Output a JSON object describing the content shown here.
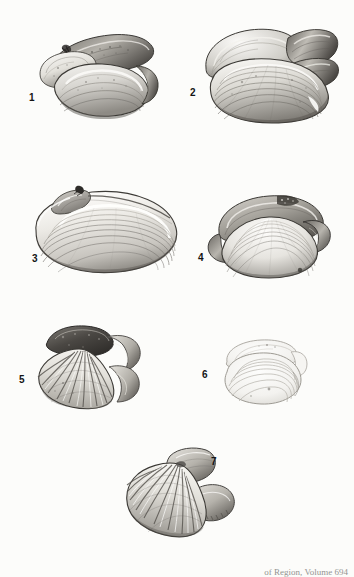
{
  "plate": {
    "medium": "halftone engraving / photographic plate",
    "subject": "fossil bivalve mollusc shells",
    "background_color": "#fcfcfa",
    "ink_color": "#2b2b2b",
    "caption": "of Region, Volume 694"
  },
  "figures": [
    {
      "number": "1",
      "label_x": 29,
      "label_y": 93,
      "description": "Paired elongate mytiliform bivalve valves, oblique view",
      "shell_type": "mussel-like bivalve",
      "ornament": "smooth with fine growth lines",
      "x": 36,
      "y": 26,
      "w": 122,
      "h": 92
    },
    {
      "number": "2",
      "label_x": 190,
      "label_y": 88,
      "description": "Two overlapping broad bivalve valves with strong concentric growth rings",
      "shell_type": "venerid bivalve",
      "ornament": "concentric growth lamellae",
      "x": 196,
      "y": 22,
      "w": 142,
      "h": 102
    },
    {
      "number": "3",
      "label_x": 32,
      "label_y": 254,
      "description": "Elongate oval clam valve, left lateral view, umbo at upper left",
      "shell_type": "mactrid clam",
      "ornament": "fine concentric striae",
      "x": 30,
      "y": 182,
      "w": 150,
      "h": 95
    },
    {
      "number": "4",
      "label_x": 198,
      "label_y": 253,
      "description": "Rounded triangular clam valve with opposing valve behind",
      "shell_type": "venerid clam",
      "ornament": "fine concentric striae",
      "x": 203,
      "y": 188,
      "w": 128,
      "h": 88
    },
    {
      "number": "5",
      "label_x": 19,
      "label_y": 375,
      "description": "Radially ribbed scallop-like valve with auricle, fan shaped",
      "shell_type": "pectinid / cardiid bivalve",
      "ornament": "strong radial ribs",
      "x": 33,
      "y": 323,
      "w": 110,
      "h": 85
    },
    {
      "number": "6",
      "label_x": 202,
      "label_y": 370,
      "description": "Faint pale bivalve valve with concentric growth outlines",
      "shell_type": "thin-shelled bivalve",
      "ornament": "faint concentric lines",
      "x": 213,
      "y": 336,
      "w": 93,
      "h": 70
    },
    {
      "number": "7",
      "label_x": 211,
      "label_y": 457,
      "description": "Ribbed fan-shaped valve with broad posterior wing, oblique view",
      "shell_type": "pectinid bivalve",
      "ornament": "strong radial ribs and growth lines",
      "x": 122,
      "y": 444,
      "w": 118,
      "h": 92
    }
  ]
}
